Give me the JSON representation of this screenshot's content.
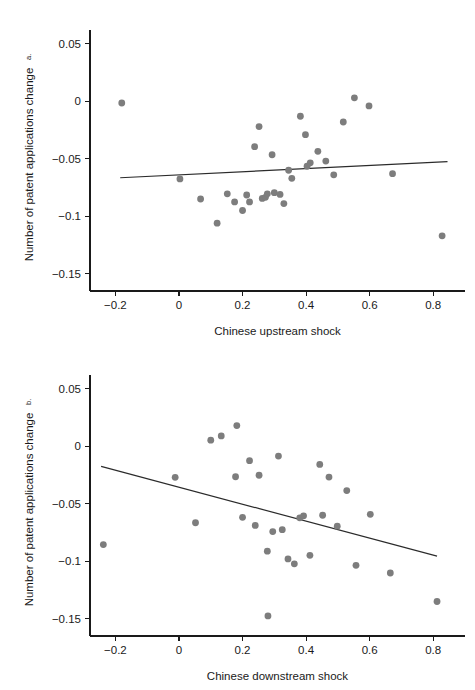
{
  "figure": {
    "panels": [
      "a",
      "b"
    ]
  },
  "chart_data": [
    {
      "type": "scatter",
      "panel_label": "a.",
      "title": "",
      "xlabel": "Chinese upstream shock",
      "ylabel": "Number of patent applications change",
      "xlim": [
        -0.28,
        0.9
      ],
      "ylim": [
        -0.165,
        0.062
      ],
      "xticks": [
        -0.2,
        0,
        0.2,
        0.4,
        0.6,
        0.8
      ],
      "xticklabels": [
        "−0.2",
        "0",
        "0.2",
        "0.4",
        "0.6",
        "0.8"
      ],
      "yticks": [
        0.05,
        0,
        -0.05,
        -0.1,
        -0.15
      ],
      "yticklabels": [
        "0.05",
        "0",
        "−0.05",
        "−0.1",
        "−0.15"
      ],
      "grid": false,
      "legend": null,
      "marker_color": "#7d7d7d",
      "fit_line_color": "#2b2b2b",
      "fit_line": {
        "x0": -0.185,
        "y0": -0.0665,
        "x1": 0.845,
        "y1": -0.0525
      },
      "points": [
        {
          "x": -0.18,
          "y": -0.0015
        },
        {
          "x": 0.003,
          "y": -0.0675
        },
        {
          "x": 0.068,
          "y": -0.085
        },
        {
          "x": 0.12,
          "y": -0.106
        },
        {
          "x": 0.152,
          "y": -0.0805
        },
        {
          "x": 0.175,
          "y": -0.0875
        },
        {
          "x": 0.2,
          "y": -0.095
        },
        {
          "x": 0.213,
          "y": -0.0815
        },
        {
          "x": 0.222,
          "y": -0.0875
        },
        {
          "x": 0.238,
          "y": -0.0395
        },
        {
          "x": 0.252,
          "y": -0.022
        },
        {
          "x": 0.262,
          "y": -0.0845
        },
        {
          "x": 0.272,
          "y": -0.0835
        },
        {
          "x": 0.278,
          "y": -0.0805
        },
        {
          "x": 0.293,
          "y": -0.0465
        },
        {
          "x": 0.3,
          "y": -0.0795
        },
        {
          "x": 0.318,
          "y": -0.081
        },
        {
          "x": 0.33,
          "y": -0.089
        },
        {
          "x": 0.345,
          "y": -0.06
        },
        {
          "x": 0.355,
          "y": -0.067
        },
        {
          "x": 0.382,
          "y": -0.013
        },
        {
          "x": 0.398,
          "y": -0.029
        },
        {
          "x": 0.403,
          "y": -0.0565
        },
        {
          "x": 0.413,
          "y": -0.0535
        },
        {
          "x": 0.437,
          "y": -0.0435
        },
        {
          "x": 0.462,
          "y": -0.052
        },
        {
          "x": 0.487,
          "y": -0.064
        },
        {
          "x": 0.517,
          "y": -0.018
        },
        {
          "x": 0.552,
          "y": 0.003
        },
        {
          "x": 0.598,
          "y": -0.004
        },
        {
          "x": 0.672,
          "y": -0.063
        },
        {
          "x": 0.828,
          "y": -0.117
        }
      ]
    },
    {
      "type": "scatter",
      "panel_label": "b.",
      "title": "",
      "xlabel": "Chinese downstream shock",
      "ylabel": "Number of patent applications change",
      "xlim": [
        -0.28,
        0.9
      ],
      "ylim": [
        -0.165,
        0.062
      ],
      "xticks": [
        -0.2,
        0,
        0.2,
        0.4,
        0.6,
        0.8
      ],
      "xticklabels": [
        "−0.2",
        "0",
        "0.2",
        "0.4",
        "0.6",
        "0.8"
      ],
      "yticks": [
        0.05,
        0,
        -0.05,
        -0.1,
        -0.15
      ],
      "yticklabels": [
        "0.05",
        "0",
        "−0.05",
        "−0.1",
        "−0.15"
      ],
      "grid": false,
      "legend": null,
      "marker_color": "#7d7d7d",
      "fit_line_color": "#2b2b2b",
      "fit_line": {
        "x0": -0.245,
        "y0": -0.0175,
        "x1": 0.812,
        "y1": -0.0955
      },
      "points": [
        {
          "x": -0.238,
          "y": -0.0855
        },
        {
          "x": -0.012,
          "y": -0.027
        },
        {
          "x": 0.052,
          "y": -0.0665
        },
        {
          "x": 0.1,
          "y": 0.0053
        },
        {
          "x": 0.133,
          "y": 0.009
        },
        {
          "x": 0.182,
          "y": 0.018
        },
        {
          "x": 0.178,
          "y": -0.0265
        },
        {
          "x": 0.2,
          "y": -0.0618
        },
        {
          "x": 0.222,
          "y": -0.0125
        },
        {
          "x": 0.24,
          "y": -0.0688
        },
        {
          "x": 0.252,
          "y": -0.0252
        },
        {
          "x": 0.278,
          "y": -0.0912
        },
        {
          "x": 0.28,
          "y": -0.1475
        },
        {
          "x": 0.295,
          "y": -0.0742
        },
        {
          "x": 0.313,
          "y": -0.0085
        },
        {
          "x": 0.325,
          "y": -0.0725
        },
        {
          "x": 0.343,
          "y": -0.098
        },
        {
          "x": 0.363,
          "y": -0.1022
        },
        {
          "x": 0.38,
          "y": -0.0622
        },
        {
          "x": 0.392,
          "y": -0.0605
        },
        {
          "x": 0.412,
          "y": -0.0948
        },
        {
          "x": 0.443,
          "y": -0.0158
        },
        {
          "x": 0.452,
          "y": -0.06
        },
        {
          "x": 0.472,
          "y": -0.0268
        },
        {
          "x": 0.498,
          "y": -0.0695
        },
        {
          "x": 0.528,
          "y": -0.0385
        },
        {
          "x": 0.557,
          "y": -0.1035
        },
        {
          "x": 0.602,
          "y": -0.0592
        },
        {
          "x": 0.665,
          "y": -0.1102
        },
        {
          "x": 0.812,
          "y": -0.135
        }
      ]
    }
  ]
}
